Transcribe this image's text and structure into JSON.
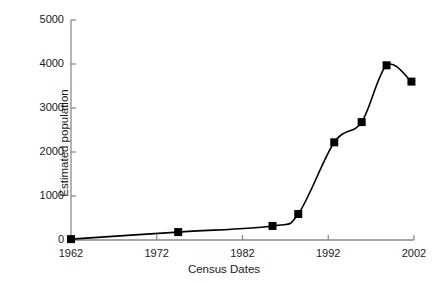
{
  "chart_data": {
    "type": "line",
    "title": "",
    "xlabel": "Census Dates",
    "ylabel": "Estimated population",
    "xlim": [
      1962,
      2002
    ],
    "ylim": [
      0,
      5000
    ],
    "xticks": [
      1962,
      1972,
      1982,
      1992,
      2002
    ],
    "xtick_labels": [
      "1962",
      "1972",
      "1982",
      "1992",
      "2002"
    ],
    "yticks": [
      0,
      1000,
      2000,
      3000,
      4000,
      5000
    ],
    "ytick_labels": [
      "0",
      "1000",
      "2000",
      "3000",
      "4000",
      "5000"
    ],
    "grid": false,
    "legend": "none",
    "marker": "filled-square",
    "line_color": "#000000",
    "marker_color": "#000000",
    "axis_color": "#808080",
    "interpolation": "smooth-spline",
    "x": [
      1962,
      1974.5,
      1985.5,
      1988.5,
      1992.7,
      1995.9,
      1998.8,
      2001.7
    ],
    "values": [
      20,
      180,
      320,
      590,
      2220,
      2680,
      3970,
      3600
    ],
    "series": [
      {
        "name": "Estimated population",
        "points": [
          {
            "x": 1962,
            "y": 20
          },
          {
            "x": 1974.5,
            "y": 180
          },
          {
            "x": 1985.5,
            "y": 320
          },
          {
            "x": 1988.5,
            "y": 590
          },
          {
            "x": 1992.7,
            "y": 2220
          },
          {
            "x": 1995.9,
            "y": 2680
          },
          {
            "x": 1998.8,
            "y": 3970
          },
          {
            "x": 2001.7,
            "y": 3600
          }
        ]
      }
    ]
  }
}
